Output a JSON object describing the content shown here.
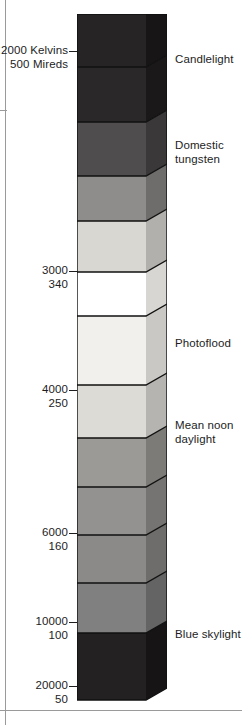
{
  "figure": {
    "type": "colour-temperature-scale",
    "orientation": "vertical"
  },
  "chart_data": {
    "type": "bar",
    "title": "",
    "xlabel": "",
    "ylabel": "",
    "axis_units": [
      "Kelvins",
      "Mireds"
    ],
    "axis_ticks": [
      {
        "kelvin": "2000",
        "mired": "500",
        "label_line1": "2000 Kelvins",
        "label_line2": "500 Mireds",
        "y": 56
      },
      {
        "kelvin": "3000",
        "mired": "340",
        "label_line1": "3000",
        "label_line2": "340",
        "y": 276
      },
      {
        "kelvin": "4000",
        "mired": "250",
        "label_line1": "4000",
        "label_line2": "250",
        "y": 395
      },
      {
        "kelvin": "6000",
        "mired": "160",
        "label_line1": "6000",
        "label_line2": "160",
        "y": 538
      },
      {
        "kelvin": "10000",
        "mired": "100",
        "label_line1": "10000",
        "label_line2": "100",
        "y": 627
      },
      {
        "kelvin": "20000",
        "mired": "50",
        "label_line1": "20000",
        "label_line2": "50",
        "y": 691
      }
    ],
    "source_labels": [
      {
        "text": "Candlelight",
        "y": 53
      },
      {
        "text": "Domestic\ntungsten",
        "y": 139
      },
      {
        "text": "Photoflood",
        "y": 337
      },
      {
        "text": "Mean noon\ndaylight",
        "y": 419
      },
      {
        "text": "Blue skylight",
        "y": 628
      }
    ],
    "bands": [
      {
        "index": 1,
        "top": 14,
        "bottom": 67,
        "front": "#262425",
        "side": "#171516"
      },
      {
        "index": 2,
        "top": 67,
        "bottom": 122,
        "front": "#2b2829",
        "side": "#1a1819"
      },
      {
        "index": 3,
        "top": 122,
        "bottom": 176,
        "front": "#4f4d4d",
        "side": "#3a3839"
      },
      {
        "index": 4,
        "top": 176,
        "bottom": 221,
        "front": "#8e8d8b",
        "side": "#6e6d6c"
      },
      {
        "index": 5,
        "top": 221,
        "bottom": 272,
        "front": "#d8d7d2",
        "side": "#b1b0ac"
      },
      {
        "index": 6,
        "top": 272,
        "bottom": 316,
        "front": "#ffffff",
        "side": "#d7d6d2"
      },
      {
        "index": 7,
        "top": 316,
        "bottom": 385,
        "front": "#f1f0ec",
        "side": "#c9c8c4"
      },
      {
        "index": 8,
        "top": 385,
        "bottom": 438,
        "front": "#dcdbd6",
        "side": "#b5b4b0"
      },
      {
        "index": 9,
        "top": 438,
        "bottom": 487,
        "front": "#9b9a97",
        "side": "#7c7b78"
      },
      {
        "index": 10,
        "top": 487,
        "bottom": 535,
        "front": "#939290",
        "side": "#757472"
      },
      {
        "index": 11,
        "top": 535,
        "bottom": 583,
        "front": "#8b8a88",
        "side": "#6e6d6b"
      },
      {
        "index": 12,
        "top": 583,
        "bottom": 633,
        "front": "#818080",
        "side": "#656464"
      },
      {
        "index": 13,
        "top": 633,
        "bottom": 700,
        "front": "#232122",
        "side": "#161415"
      }
    ],
    "colors": {
      "outline": "#111111",
      "text": "#1d1d1d",
      "page_rule": "#9a9a9a",
      "background": "#ffffff"
    },
    "geometry": {
      "front_left_x": 77,
      "front_right_x": 146,
      "side_right_x": 167,
      "bevel_dy": 12,
      "top_y": 14,
      "bottom_y": 700
    }
  }
}
